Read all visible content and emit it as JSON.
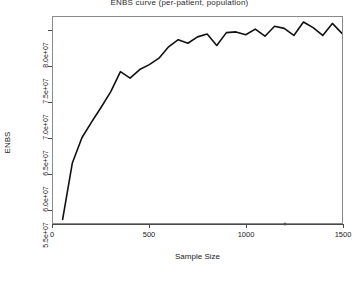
{
  "chart_data": {
    "type": "line",
    "title": "ENBS curve (per-patient, population)",
    "xlabel": "Sample Size",
    "ylabel": "ENBS",
    "xlim": [
      0,
      1500
    ],
    "ylim": [
      53000000,
      82000000
    ],
    "grid": false,
    "legend": "none",
    "xticks": [
      0,
      500,
      1000,
      1500
    ],
    "xtick_labels": [
      "0",
      "500",
      "1000",
      "1500"
    ],
    "yticks": [
      55000000,
      60000000,
      65000000,
      70000000,
      75000000,
      80000000
    ],
    "ytick_labels": [
      "5.5e+07",
      "6.0e+07",
      "6.5e+07",
      "7.0e+07",
      "7.5e+07",
      "8.0e+07"
    ],
    "series": [
      {
        "name": "ENBS",
        "color": "#111111",
        "x": [
          50,
          100,
          150,
          200,
          250,
          300,
          350,
          400,
          450,
          500,
          550,
          600,
          650,
          700,
          750,
          800,
          850,
          900,
          950,
          1000,
          1050,
          1100,
          1150,
          1200,
          1250,
          1300,
          1350,
          1400,
          1450,
          1500
        ],
        "y": [
          53500000,
          61400000,
          65000000,
          67200000,
          69300000,
          71500000,
          74300000,
          73400000,
          74600000,
          75300000,
          76200000,
          77800000,
          78800000,
          78300000,
          79200000,
          79600000,
          78000000,
          79800000,
          79900000,
          79500000,
          80300000,
          79300000,
          80700000,
          80400000,
          79400000,
          81300000,
          80500000,
          79400000,
          81100000,
          79700000
        ]
      }
    ],
    "annotations": [
      {
        "name": "optimal-sample-size-marker",
        "x": 1200,
        "y": 53000000,
        "label": ""
      }
    ]
  }
}
